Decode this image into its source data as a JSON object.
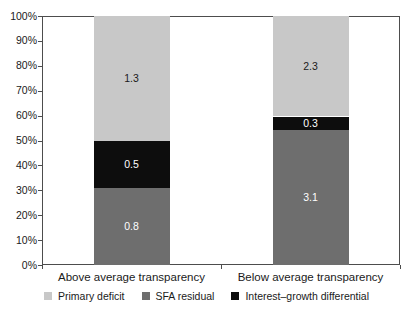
{
  "chart_data": {
    "type": "bar",
    "variant": "stacked-100-percent",
    "categories": [
      "Above average transparency",
      "Below average transparency"
    ],
    "series": [
      {
        "name": "SFA residual",
        "values": [
          0.8,
          3.1
        ],
        "color": "#6e6e6e",
        "label_color": "#ffffff"
      },
      {
        "name": "Interest–growth differential",
        "values": [
          0.5,
          0.3
        ],
        "color": "#0d0d0d",
        "label_color": "#ffffff"
      },
      {
        "name": "Primary deficit",
        "values": [
          1.3,
          2.3
        ],
        "color": "#c8c8c8",
        "label_color": "#1a1a1a"
      }
    ],
    "segment_labels": {
      "above_average": {
        "primary_deficit": "1.3",
        "interest_growth_differential": "0.5",
        "sfa_residual": "0.8"
      },
      "below_average": {
        "primary_deficit": "2.3",
        "interest_growth_differential": "0.3",
        "sfa_residual": "3.1"
      }
    },
    "legend_order": [
      "Primary deficit",
      "SFA residual",
      "Interest–growth differential"
    ],
    "legend_position": "bottom",
    "y_ticks": [
      "0%",
      "10%",
      "20%",
      "30%",
      "40%",
      "50%",
      "60%",
      "70%",
      "80%",
      "90%",
      "100%"
    ],
    "ylim": [
      0,
      100
    ],
    "xlabel": "",
    "ylabel": "",
    "title": "",
    "grid": false,
    "axis_color": "#4d4d4d",
    "text_color": "#1a1a1a",
    "background_color": "#ffffff"
  }
}
